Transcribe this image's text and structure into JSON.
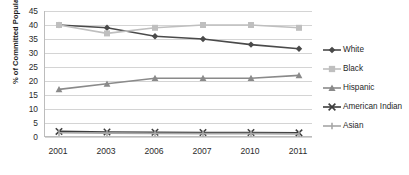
{
  "chart_data": {
    "type": "line",
    "title": "",
    "xlabel": "",
    "ylabel": "% of Committed Population",
    "categories": [
      "2001",
      "2003",
      "2006",
      "2007",
      "2010",
      "2011"
    ],
    "ylim": [
      0,
      45
    ],
    "ytick_step": 5,
    "yticks": [
      "45",
      "40",
      "35",
      "30",
      "25",
      "20",
      "15",
      "10",
      "5",
      "0"
    ],
    "grid": true,
    "legend_position": "right",
    "series": [
      {
        "name": "White",
        "marker": "diamond",
        "color": "#4a4a4a",
        "values": [
          40,
          39,
          36,
          35,
          33,
          31.5
        ]
      },
      {
        "name": "Black",
        "marker": "square",
        "color": "#bfbfbf",
        "values": [
          40,
          37,
          39,
          40,
          40,
          39
        ]
      },
      {
        "name": "Hispanic",
        "marker": "triangle",
        "color": "#8a8a8a",
        "values": [
          17,
          19,
          21,
          21,
          21,
          22
        ]
      },
      {
        "name": "American Indian",
        "marker": "x",
        "color": "#3d3d3d",
        "values": [
          2,
          1.8,
          1.7,
          1.6,
          1.6,
          1.5
        ]
      },
      {
        "name": "Asian",
        "marker": "dash",
        "color": "#a6a6a6",
        "values": [
          1.5,
          1.4,
          1.3,
          1.2,
          1.2,
          1.1
        ]
      }
    ]
  }
}
